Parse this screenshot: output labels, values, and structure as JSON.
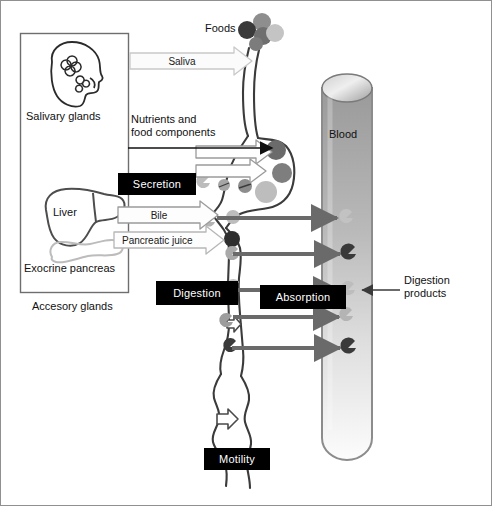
{
  "figure": {
    "type": "diagram",
    "border_color": "#808080",
    "background": "#ffffff"
  },
  "accessory_glands_panel": {
    "caption": "Accesory glands",
    "border_color": "#6e6e6e",
    "organs": [
      {
        "name": "salivary-glands",
        "label": "Salivary glands"
      },
      {
        "name": "liver",
        "label": "Liver"
      },
      {
        "name": "exocrine-pancreas",
        "label": "Exocrine pancreas"
      }
    ]
  },
  "labels": {
    "foods": "Foods",
    "blood": "Blood",
    "nutrients": "Nutrients and\nfood components",
    "digestion_products": "Digestion\nproducts"
  },
  "process_boxes": [
    {
      "name": "secretion",
      "label": "Secretion"
    },
    {
      "name": "digestion",
      "label": "Digestion"
    },
    {
      "name": "absorption",
      "label": "Absorption"
    },
    {
      "name": "motility",
      "label": "Motility"
    }
  ],
  "secretion_arrows": [
    {
      "name": "saliva",
      "label": "Saliva"
    },
    {
      "name": "bile",
      "label": "Bile"
    },
    {
      "name": "pancreatic-juice",
      "label": "Pancreatic juice"
    }
  ],
  "absorption_arrows": {
    "count": 5,
    "color": "#6a6a6a",
    "direction": "gut-to-blood"
  },
  "colors": {
    "arrow_gray": "#6a6a6a",
    "outline_dark": "#333333",
    "tract_outline": "#3b3b3b",
    "blood_tube_fill_top": "#9c9c9c",
    "blood_tube_fill_bottom": "#fdfdfd",
    "blood_tube_stroke": "#8c8c8c",
    "food_particle_darkest": "#3a3a3a",
    "food_particle_mid": "#8e8e8e",
    "food_particle_light": "#c9c9c9",
    "pancreas_outline": "#b9b9b9",
    "box_black": "#000000",
    "box_text": "#ffffff"
  },
  "food_particles_cluster": [
    {
      "cx": 262,
      "cy": 22,
      "r": 9,
      "fill": "#8e8e8e"
    },
    {
      "cx": 247,
      "cy": 30,
      "r": 9,
      "fill": "#3a3a3a"
    },
    {
      "cx": 262,
      "cy": 36,
      "r": 9,
      "fill": "#6f6f6f"
    },
    {
      "cx": 274,
      "cy": 34,
      "r": 9,
      "fill": "#c4c4c4"
    },
    {
      "cx": 255,
      "cy": 43,
      "r": 7,
      "fill": "#7c7c7c"
    }
  ],
  "stomach_particles": [
    {
      "cx": 275,
      "cy": 148,
      "r": 10,
      "fill": "#6b6b6b"
    },
    {
      "cx": 281,
      "cy": 172,
      "r": 10,
      "fill": "#7e7e7e"
    },
    {
      "cx": 266,
      "cy": 191,
      "r": 11,
      "fill": "#bdbdbd"
    },
    {
      "cx": 245,
      "cy": 185,
      "r": 7,
      "fill": "#8a8a8a"
    },
    {
      "cx": 224,
      "cy": 184,
      "r": 6,
      "fill": "#a5a5a5"
    },
    {
      "cx": 233,
      "cy": 216,
      "r": 7,
      "fill": "#bdbdbd"
    },
    {
      "cx": 232,
      "cy": 238,
      "r": 8,
      "fill": "#2f2f2f"
    }
  ],
  "blood_particles": [
    {
      "cx": 347,
      "cy": 218,
      "fill": "#c2c2c2"
    },
    {
      "cx": 350,
      "cy": 254,
      "fill": "#3a3a3a"
    },
    {
      "cx": 349,
      "cy": 290,
      "fill": "#bdbdbd"
    },
    {
      "cx": 347,
      "cy": 315,
      "fill": "#b4b4b4"
    },
    {
      "cx": 350,
      "cy": 347,
      "fill": "#3a3a3a"
    }
  ]
}
